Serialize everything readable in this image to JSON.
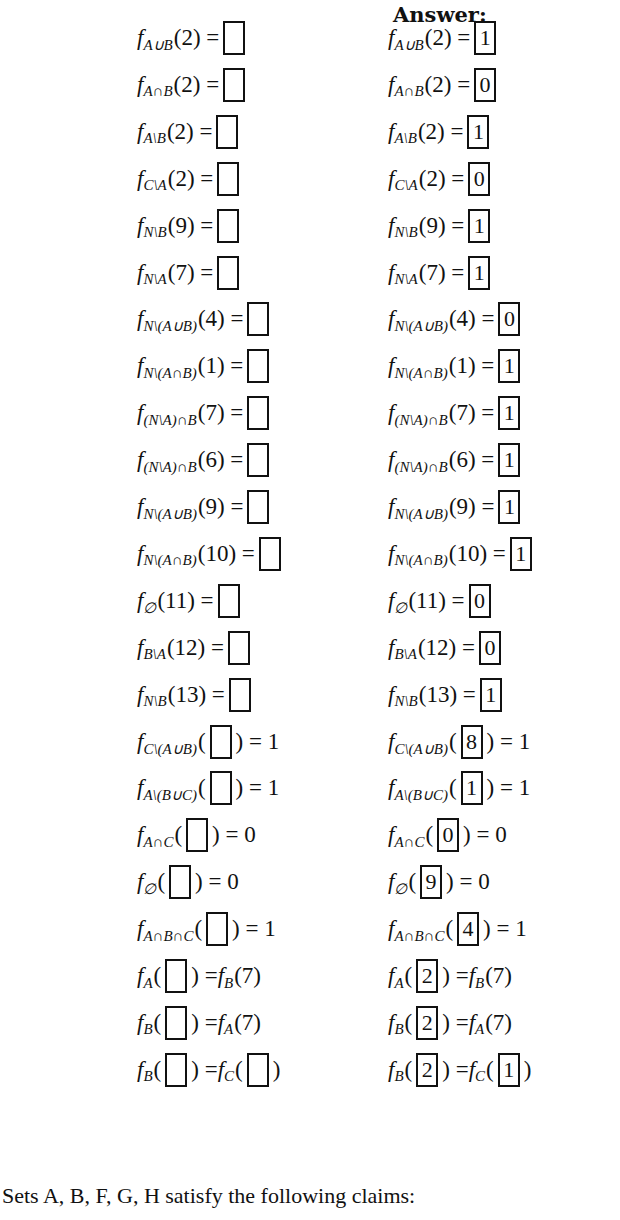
{
  "header": {
    "answer_label": "Answer:"
  },
  "rows": [
    {
      "pre": "",
      "sub": "A∪B",
      "arg": "(2)",
      "post": " = ",
      "answer": "1",
      "mode": "rhs",
      "tail": ""
    },
    {
      "pre": "",
      "sub": "A∩B",
      "arg": "(2)",
      "post": " = ",
      "answer": "0",
      "mode": "rhs",
      "tail": ""
    },
    {
      "pre": "",
      "sub": "A\\B",
      "arg": "(2)",
      "post": " = ",
      "answer": "1",
      "mode": "rhs",
      "tail": ""
    },
    {
      "pre": "",
      "sub": "C\\A",
      "arg": "(2)",
      "post": " = ",
      "answer": "0",
      "mode": "rhs",
      "tail": ""
    },
    {
      "pre": "",
      "sub": "N\\B",
      "arg": "(9)",
      "post": " = ",
      "answer": "1",
      "mode": "rhs",
      "tail": ""
    },
    {
      "pre": "",
      "sub": "N\\A",
      "arg": "(7)",
      "post": " = ",
      "answer": "1",
      "mode": "rhs",
      "tail": ""
    },
    {
      "pre": "",
      "sub": "N\\(A∪B)",
      "arg": "(4)",
      "post": " = ",
      "answer": "0",
      "mode": "rhs",
      "tail": ""
    },
    {
      "pre": "",
      "sub": "N\\(A∩B)",
      "arg": "(1)",
      "post": " = ",
      "answer": "1",
      "mode": "rhs",
      "tail": ""
    },
    {
      "pre": "",
      "sub": "(N\\A)∩B",
      "arg": "(7)",
      "post": " = ",
      "answer": "1",
      "mode": "rhs",
      "tail": ""
    },
    {
      "pre": "",
      "sub": "(N\\A)∩B",
      "arg": "(6)",
      "post": " = ",
      "answer": "1",
      "mode": "rhs",
      "tail": ""
    },
    {
      "pre": "",
      "sub": "N\\(A∪B)",
      "arg": "(9)",
      "post": " = ",
      "answer": "1",
      "mode": "rhs",
      "tail": ""
    },
    {
      "pre": "",
      "sub": "N\\(A∩B)",
      "arg": "(10)",
      "post": " = ",
      "answer": "1",
      "mode": "rhs",
      "tail": ""
    },
    {
      "pre": "",
      "sub": "∅",
      "arg": "(11)",
      "post": " = ",
      "answer": "0",
      "mode": "rhs",
      "tail": ""
    },
    {
      "pre": "",
      "sub": "B\\A",
      "arg": "(12)",
      "post": " = ",
      "answer": "0",
      "mode": "rhs",
      "tail": ""
    },
    {
      "pre": "",
      "sub": "N\\B",
      "arg": "(13)",
      "post": " = ",
      "answer": "1",
      "mode": "rhs",
      "tail": ""
    },
    {
      "pre": "",
      "sub": "C\\(A∪B)",
      "arg": "",
      "post": "",
      "answer": "8",
      "mode": "arg",
      "tail": " = 1"
    },
    {
      "pre": "",
      "sub": "A\\(B∪C)",
      "arg": "",
      "post": "",
      "answer": "1",
      "mode": "arg",
      "tail": " = 1"
    },
    {
      "pre": "",
      "sub": "A∩C",
      "arg": "",
      "post": "",
      "answer": "0",
      "mode": "arg",
      "tail": " = 0"
    },
    {
      "pre": "",
      "sub": "∅",
      "arg": "",
      "post": "",
      "answer": "9",
      "mode": "arg",
      "tail": " = 0"
    },
    {
      "pre": "",
      "sub": "A∩B∩C",
      "arg": "",
      "post": "",
      "answer": "4",
      "mode": "arg",
      "tail": " = 1"
    },
    {
      "pre": "",
      "sub": "A",
      "arg": "",
      "post": "",
      "answer": "2",
      "mode": "arg",
      "tail": " = f_B(7)"
    },
    {
      "pre": "",
      "sub": "B",
      "arg": "",
      "post": "",
      "answer": "2",
      "mode": "arg",
      "tail": " = f_A(7)"
    },
    {
      "pre": "",
      "sub": "B",
      "arg": "",
      "post": "",
      "answer": "2",
      "mode": "arg2",
      "tail": " = f_C(",
      "answer2": "1"
    }
  ],
  "footer": {
    "text": "Sets A, B, F, G, H satisfy the following claims:"
  }
}
